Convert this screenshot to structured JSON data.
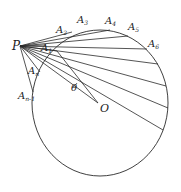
{
  "diagram": {
    "type": "geometry",
    "stroke_color": "#2a2a2a",
    "circle": {
      "cx": 100,
      "cy": 103,
      "rx": 68,
      "ry": 73
    },
    "point_P": {
      "x": 20,
      "y": 46
    },
    "point_O": {
      "x": 98,
      "y": 103
    },
    "chord_endpoints": [
      {
        "x": 46,
        "y": 45
      },
      {
        "x": 72,
        "y": 32
      },
      {
        "x": 110,
        "y": 30
      },
      {
        "x": 128,
        "y": 36
      },
      {
        "x": 147,
        "y": 49
      },
      {
        "x": 158,
        "y": 64
      },
      {
        "x": 166,
        "y": 86
      },
      {
        "x": 168,
        "y": 108
      },
      {
        "x": 163,
        "y": 130
      },
      {
        "x": 57,
        "y": 51
      },
      {
        "x": 40,
        "y": 72
      },
      {
        "x": 33,
        "y": 92
      }
    ],
    "labels": {
      "P": {
        "text": "P",
        "sub": ""
      },
      "A1": {
        "text": "A",
        "sub": "1"
      },
      "A2": {
        "text": "A",
        "sub": "2"
      },
      "A3": {
        "text": "A",
        "sub": "3"
      },
      "A4": {
        "text": "A",
        "sub": "4"
      },
      "A5": {
        "text": "A",
        "sub": "5"
      },
      "A6": {
        "text": "A",
        "sub": "6"
      },
      "An": {
        "text": "A",
        "sub": "n"
      },
      "An1": {
        "text": "A",
        "sub": "n-1"
      },
      "theta": {
        "text": "θ",
        "sub": ""
      },
      "O": {
        "text": "O",
        "sub": ""
      }
    }
  }
}
